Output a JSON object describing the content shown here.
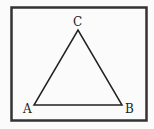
{
  "figure": {
    "type": "triangle",
    "frame": {
      "x": 11,
      "y": 7,
      "width": 136,
      "height": 114,
      "stroke": "#333333"
    },
    "vertices": [
      {
        "name": "A",
        "label": "A",
        "x": 34,
        "y": 105,
        "label_x": 23,
        "label_y": 113
      },
      {
        "name": "B",
        "label": "B",
        "x": 122,
        "y": 105,
        "label_x": 125,
        "label_y": 113
      },
      {
        "name": "C",
        "label": "C",
        "x": 78,
        "y": 30,
        "label_x": 73,
        "label_y": 26
      }
    ]
  }
}
